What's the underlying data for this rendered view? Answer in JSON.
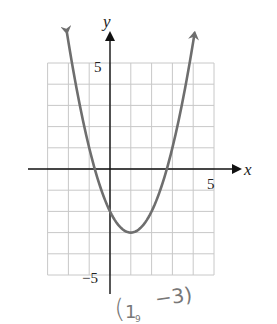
{
  "chart_data": {
    "type": "line",
    "title": "",
    "xlabel": "x",
    "ylabel": "y",
    "function": "y = (x - 1)^2 - 3",
    "xlim": [
      -3,
      5
    ],
    "ylim": [
      -5,
      5
    ],
    "grid": true,
    "grid_step": 1,
    "tick_labels": {
      "x": [
        "5"
      ],
      "y": [
        "5",
        "-5"
      ]
    },
    "vertex": [
      1,
      -3
    ],
    "y_intercept": [
      0,
      -2
    ],
    "x_intercepts": [
      -0.73,
      2.73
    ],
    "series": [
      {
        "name": "parabola",
        "x": [
          -2.07,
          -2,
          -1,
          0,
          1,
          2,
          3,
          4,
          4.07
        ],
        "y": [
          6.4,
          6,
          1,
          -2,
          -3,
          -2,
          1,
          6,
          6.4
        ]
      }
    ],
    "annotations": [
      {
        "text": "(1, -3)",
        "style": "handwritten",
        "points_to": [
          1,
          -3
        ]
      }
    ],
    "colors": {
      "curve": "#6e6e6e",
      "grid": "#c8c8c8",
      "axes": "#111111"
    }
  },
  "labels": {
    "x_axis": "x",
    "y_axis": "y",
    "x_tick_5": "5",
    "y_tick_5": "5",
    "y_tick_neg5": "−5",
    "annotation_open": "(",
    "annotation_x": "1",
    "annotation_sep": "₉",
    "annotation_y": "−3)"
  }
}
